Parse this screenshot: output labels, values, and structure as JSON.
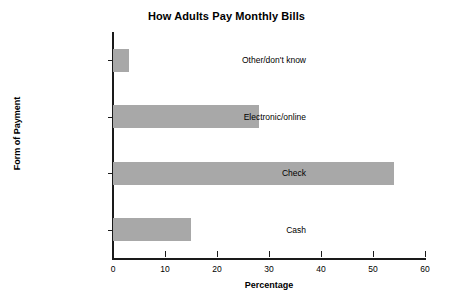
{
  "chart_data": {
    "type": "bar",
    "orientation": "horizontal",
    "title": "How Adults Pay Monthly Bills",
    "xlabel": "Percentage",
    "ylabel": "Form of Payment",
    "categories": [
      "Cash",
      "Check",
      "Electronic/online",
      "Other/don't know"
    ],
    "values": [
      15,
      54,
      28,
      3
    ],
    "xlim": [
      0,
      60
    ],
    "xticks": [
      0,
      10,
      20,
      30,
      40,
      50,
      60
    ],
    "xtick_labels": [
      "0",
      "10",
      "20",
      "30",
      "40",
      "50",
      "60"
    ],
    "grid": false,
    "legend": null,
    "series": [
      {
        "name": "Percentage",
        "values": [
          15,
          54,
          28,
          3
        ]
      }
    ],
    "colors": {
      "bar_fill": "#a8a8a8",
      "axis": "#1a1a1a",
      "text": "#000000",
      "background": "#ffffff"
    }
  }
}
